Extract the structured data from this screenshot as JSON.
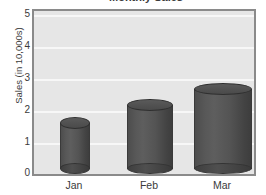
{
  "chart_data": {
    "type": "bar",
    "title": "Monthly Sales",
    "categories": [
      "Jan",
      "Feb",
      "Mar"
    ],
    "values": [
      1.8,
      2.35,
      2.85
    ],
    "xlabel": "",
    "ylabel": "Sales (in 10,000s)",
    "ylim": [
      0,
      5
    ],
    "yticks": [
      "0",
      "1",
      "2",
      "3",
      "4",
      "5"
    ],
    "grid": true,
    "legend": "none",
    "style": "3d-cylinder",
    "colors": {
      "bar_fill": "#4f4f4f",
      "bar_edge": "#333333",
      "plot_background": "#e6e6e6",
      "plot_border": "#8a8a8a",
      "gridline": "#f7f7f7",
      "text": "#3b3b3b"
    }
  }
}
